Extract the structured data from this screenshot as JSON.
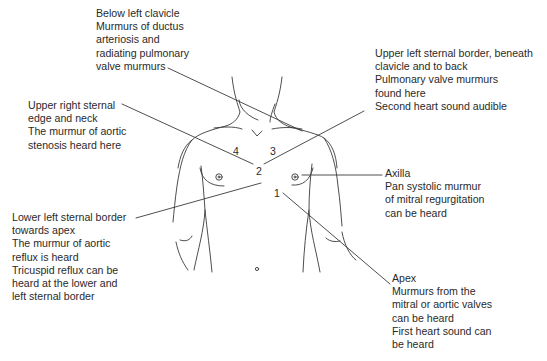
{
  "diagram": {
    "labels": {
      "below_left_clavicle": {
        "lines": [
          "Below left clavicle",
          "Murmurs of ductus",
          "arteriosis and",
          "radiating pulmonary",
          "valve murmurs"
        ]
      },
      "upper_left_sternal": {
        "lines": [
          "Upper left sternal border, beneath",
          "clavicle and to back",
          "Pulmonary valve murmurs",
          "found here",
          "Second heart sound audible"
        ]
      },
      "upper_right_sternal": {
        "lines": [
          "Upper right sternal",
          "edge and neck",
          "The murmur of aortic",
          "stenosis heard here"
        ]
      },
      "axilla": {
        "lines": [
          "Axilla",
          "Pan systolic murmur",
          "of mitral regurgitation",
          "can be heard"
        ]
      },
      "lower_left_sternal": {
        "lines": [
          "Lower left sternal border",
          "towards apex",
          "The murmur of aortic",
          "reflux is heard",
          "Tricuspid reflux can be",
          "heard at the lower and",
          "left sternal border"
        ]
      },
      "apex": {
        "lines": [
          "Apex",
          "Murmurs from the",
          "mitral or aortic valves",
          "can be heard",
          "First heart sound can",
          "be heard"
        ]
      }
    },
    "points": {
      "p1": "1",
      "p2": "2",
      "p3": "3",
      "p4": "4"
    },
    "colors": {
      "line": "#3a3a3a",
      "text": "#2a2a2a",
      "background": "#ffffff"
    }
  }
}
